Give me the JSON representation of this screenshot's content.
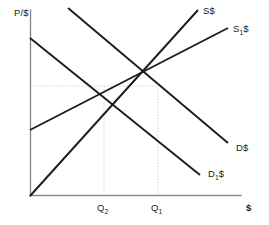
{
  "chart_data": {
    "type": "line",
    "title": "",
    "xlabel": "$",
    "ylabel": "P/$",
    "grid": false,
    "legend": "inline-curve-labels",
    "axes": {
      "origin": [
        30,
        196
      ],
      "y_axis_top": [
        30,
        10
      ],
      "x_axis_right": [
        240,
        196
      ],
      "y_label": "P/$",
      "x_label": "$"
    },
    "series": [
      {
        "name": "S$",
        "label": "S$",
        "role": "supply-original",
        "direction": "upward-sloping",
        "points": [
          [
            30,
            196
          ],
          [
            198,
            10
          ]
        ]
      },
      {
        "name": "S1$",
        "label": "S",
        "label_sub": "1",
        "label_suffix": "$",
        "role": "supply-shifted-right",
        "direction": "upward-sloping",
        "points": [
          [
            30,
            130
          ],
          [
            228,
            28
          ]
        ]
      },
      {
        "name": "D$",
        "label": "D$",
        "role": "demand-original",
        "direction": "downward-sloping",
        "points": [
          [
            68,
            8
          ],
          [
            228,
            143
          ]
        ]
      },
      {
        "name": "D1$",
        "label": "D",
        "label_sub": "1",
        "label_suffix": "$",
        "role": "demand-shifted-left",
        "direction": "downward-sloping",
        "points": [
          [
            30,
            38
          ],
          [
            200,
            175
          ]
        ]
      }
    ],
    "intersections": [
      {
        "name": "equilibrium-2",
        "quantity_label": "Q2",
        "curves": [
          "S1$",
          "D1$"
        ],
        "x": 104,
        "y": 86
      },
      {
        "name": "equilibrium-1",
        "quantity_label": "Q1",
        "curves": [
          "S$",
          "D$"
        ],
        "x": 158,
        "y": 86
      }
    ],
    "guides": [
      {
        "name": "price-guide-horizontal",
        "from": [
          30,
          86
        ],
        "to": [
          158,
          86
        ],
        "style": "dotted"
      },
      {
        "name": "q2-guide-vertical",
        "from": [
          104,
          86
        ],
        "to": [
          104,
          196
        ],
        "style": "dotted"
      },
      {
        "name": "q1-guide-vertical",
        "from": [
          158,
          86
        ],
        "to": [
          158,
          196
        ],
        "style": "dotted"
      }
    ],
    "tick_labels": {
      "x": [
        {
          "label": "Q",
          "sub": "2",
          "x": 104
        },
        {
          "label": "Q",
          "sub": "1",
          "x": 158
        }
      ],
      "y": []
    },
    "colors": {
      "background": "#ffffff",
      "curve": "#1c1c1c",
      "axis": "#8a8a8a",
      "guide": "#c9c9c9",
      "text": "#1c1c1c"
    }
  },
  "labels": {
    "y_axis": "P/$",
    "x_axis": "$",
    "supply": "S$",
    "supply_shifted_base": "S",
    "supply_shifted_sub": "1",
    "supply_shifted_suffix": "$",
    "demand": "D$",
    "demand_shifted_base": "D",
    "demand_shifted_sub": "1",
    "demand_shifted_suffix": "$",
    "quantity_2_base": "Q",
    "quantity_2_sub": "2",
    "quantity_1_base": "Q",
    "quantity_1_sub": "1"
  }
}
